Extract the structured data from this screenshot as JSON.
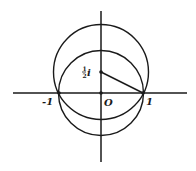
{
  "diagram": {
    "axes": {
      "horizontal": "real axis",
      "vertical": "imaginary axis"
    },
    "labels": {
      "origin": "O",
      "minus_one": "-1",
      "one": "1",
      "center_numer": "1",
      "center_denom": "2",
      "center_i": "i",
      "center_full": "½i"
    },
    "points": [
      {
        "name": "origin",
        "label": "O",
        "coord": [
          0,
          0
        ]
      },
      {
        "name": "minus-one",
        "label": "-1",
        "coord": [
          -1,
          0
        ]
      },
      {
        "name": "one",
        "label": "1",
        "coord": [
          1,
          0
        ]
      },
      {
        "name": "half-i",
        "label": "½i",
        "coord": [
          0,
          0.5
        ]
      }
    ],
    "circles": [
      {
        "name": "unit-circle",
        "center": [
          0,
          0
        ],
        "radius": 1
      },
      {
        "name": "circle-about-half-i",
        "center": [
          0,
          0.5
        ],
        "radius": 1.118
      }
    ],
    "segments": [
      {
        "name": "radius-half-i-to-one",
        "from": [
          0,
          0.5
        ],
        "to": [
          1,
          0
        ]
      }
    ],
    "colors": {
      "ink": "#1a1a1a",
      "background": "#ffffff"
    }
  }
}
